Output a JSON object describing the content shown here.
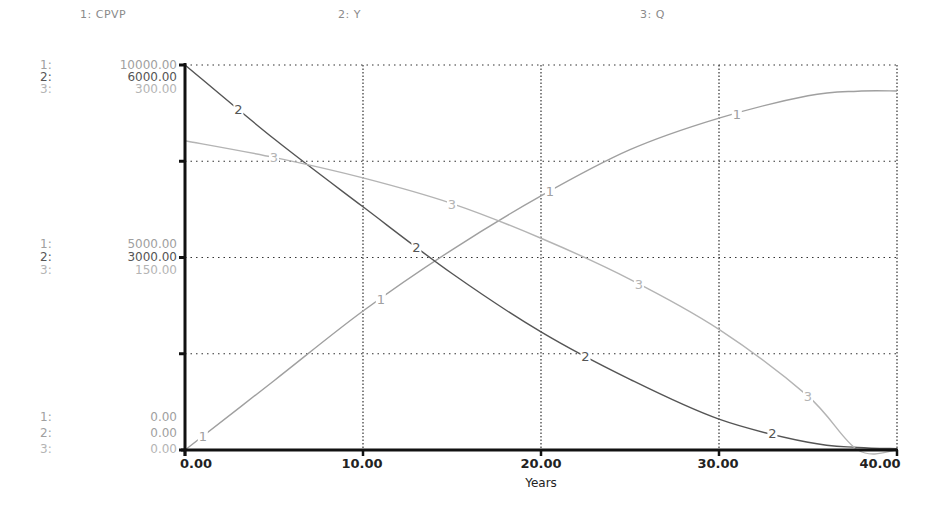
{
  "legend": [
    {
      "label": "1: CPVP",
      "x": 80
    },
    {
      "label": "2: Y",
      "x": 338
    },
    {
      "label": "3: Q",
      "x": 640
    }
  ],
  "y_axis_labels": {
    "top": [
      {
        "idx": "1:",
        "val": "10000.00"
      },
      {
        "idx": "2:",
        "val": "6000.00"
      },
      {
        "idx": "3:",
        "val": "300.00"
      }
    ],
    "middle": [
      {
        "idx": "1:",
        "val": "5000.00"
      },
      {
        "idx": "2:",
        "val": "3000.00"
      },
      {
        "idx": "3:",
        "val": "150.00"
      }
    ],
    "bottom": [
      {
        "idx": "1:",
        "val": "0.00"
      },
      {
        "idx": "2:",
        "val": "0.00"
      },
      {
        "idx": "3:",
        "val": "0.00"
      }
    ]
  },
  "x_ticks": [
    "0.00",
    "10.00",
    "20.00",
    "30.00",
    "40.00"
  ],
  "x_label": "Years",
  "colors": {
    "series1": "#a0a0a0",
    "series2": "#555555",
    "series3": "#b4b4b4",
    "axis": "#111111",
    "grid": "#333333"
  },
  "chart_data": {
    "type": "line",
    "title": "",
    "xlabel": "Years",
    "ylabel": "",
    "xlim": [
      0,
      40
    ],
    "grid": true,
    "legend_position": "top",
    "x": [
      0,
      5,
      10,
      15,
      20,
      25,
      30,
      35,
      37.8,
      40
    ],
    "series": [
      {
        "name": "1: CPVP",
        "axis_range": [
          0,
          10000
        ],
        "values": [
          0,
          1800,
          3610,
          5200,
          6600,
          7800,
          8620,
          9200,
          9320,
          9325
        ]
      },
      {
        "name": "2: Y",
        "axis_range": [
          0,
          6000
        ],
        "values": [
          6000,
          4850,
          3790,
          2750,
          1840,
          1100,
          480,
          120,
          40,
          20
        ]
      },
      {
        "name": "3: Q",
        "axis_range": [
          0,
          300
        ],
        "values": [
          241,
          228,
          212,
          192,
          165,
          133,
          94,
          42,
          0,
          0
        ]
      }
    ],
    "y_tick_labels": {
      "1: CPVP": [
        "0.00",
        "5000.00",
        "10000.00"
      ],
      "2: Y": [
        "0.00",
        "3000.00",
        "6000.00"
      ],
      "3: Q": [
        "0.00",
        "150.00",
        "300.00"
      ]
    },
    "x_tick_labels": [
      "0.00",
      "10.00",
      "20.00",
      "30.00",
      "40.00"
    ]
  }
}
